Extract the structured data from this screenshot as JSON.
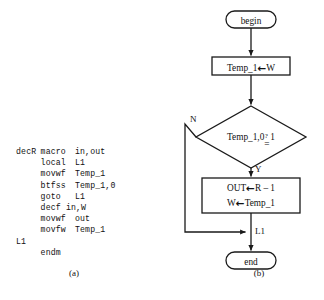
{
  "figure": {
    "caption_a": "(a)",
    "caption_b": "(b)"
  },
  "code": {
    "title": "decR macro listing",
    "lines": [
      {
        "label": "decR",
        "op": "macro",
        "operand": "in,out"
      },
      {
        "label": "",
        "op": "local",
        "operand": "L1"
      },
      {
        "label": "",
        "op": "movwf",
        "operand": "Temp_1"
      },
      {
        "label": "",
        "op": "btfss",
        "operand": "Temp_1,0"
      },
      {
        "label": "",
        "op": "goto",
        "operand": "L1"
      },
      {
        "label": "",
        "free": "decf in,W"
      },
      {
        "label": "",
        "op": "movwf",
        "operand": "out"
      },
      {
        "label": "",
        "op": "movfw",
        "operand": "Temp_1"
      },
      {
        "label": "L1",
        "op": "",
        "operand": ""
      },
      {
        "label": "",
        "op": "endm",
        "operand": ""
      }
    ]
  },
  "flowchart": {
    "type": "flowchart",
    "nodes": {
      "begin": {
        "shape": "terminator",
        "label": "begin"
      },
      "load_temp": {
        "shape": "process",
        "left": "Temp_1",
        "arrow": "←",
        "right": "W"
      },
      "decision": {
        "shape": "decision",
        "left": "Temp_1,0",
        "question": "?",
        "equals": "=",
        "right": "1"
      },
      "action": {
        "shape": "process",
        "line1_left": "OUT",
        "line1_arrow": "←",
        "line1_right": "R – 1",
        "line2_left": "W",
        "line2_arrow": "←",
        "line2_right": "Temp_1"
      },
      "end": {
        "shape": "terminator",
        "label": "end"
      }
    },
    "edge_labels": {
      "no": "N",
      "yes": "Y",
      "junction": "L1"
    },
    "colors": {
      "stroke": "#1a1a1a",
      "fill": "#ffffff",
      "text": "#111111"
    }
  }
}
